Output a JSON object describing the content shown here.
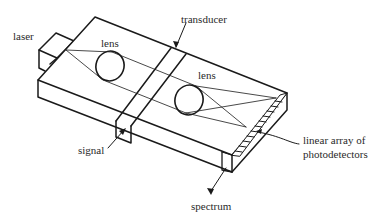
{
  "diagram": {
    "type": "acousto-optic spectrum analyzer schematic",
    "labels": {
      "laser": "laser",
      "lens1": "lens",
      "transducer": "transducer",
      "lens2": "lens",
      "signal": "signal",
      "array_line1": "linear array of",
      "array_line2": "photodetectors",
      "spectrum": "spectrum"
    },
    "colors": {
      "stroke": "#1a1a1a",
      "background": "#ffffff",
      "text": "#2a2a2a"
    }
  }
}
